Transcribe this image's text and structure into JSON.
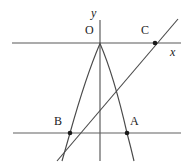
{
  "figure": {
    "type": "geometry-diagram",
    "canvas": {
      "width": 193,
      "height": 167,
      "background": "#ffffff"
    },
    "colors": {
      "axis": "#585858",
      "curve": "#4a4a4a",
      "line": "#4a4a4a",
      "auxiliary": "#606060",
      "point": "#1a1a1a",
      "label": "#1a1a1a"
    },
    "axes": {
      "x_axis": {
        "label": "x",
        "y": 43,
        "x_start": 12,
        "x_end": 181
      },
      "y_axis": {
        "label": "y",
        "x": 100,
        "y_start": 20,
        "y_end": 161
      },
      "origin_label": "O"
    },
    "auxiliary_line": {
      "y": 133,
      "x_start": 13,
      "x_end": 181
    },
    "points": [
      {
        "label": "O",
        "x": 100,
        "y": 43,
        "label_dx": -13,
        "label_dy": -17,
        "dot": false
      },
      {
        "label": "C",
        "x": 155,
        "y": 43,
        "label_dx": -13,
        "label_dy": -17,
        "dot": true
      },
      {
        "label": "A",
        "x": 127,
        "y": 133,
        "label_dx": 4,
        "label_dy": -16,
        "dot": true
      },
      {
        "label": "B",
        "x": 70,
        "y": 133,
        "label_dx": -16,
        "label_dy": -16,
        "dot": true
      }
    ],
    "parabola": {
      "vertex": {
        "x": 100,
        "y": 43
      },
      "passes_through": [
        "O",
        "B",
        "A"
      ],
      "opens": "down",
      "path": "M 62 161 Q 62 161 70 133 Q 86 76 100 43.5 Q 114 76 127 133 Q 131 148 134 161"
    },
    "secant_line": {
      "passes_through": [
        "B",
        "C"
      ],
      "x_start": 57,
      "y_start": 161,
      "x_end": 178,
      "y_end": 19
    },
    "extra_curve_tail": {
      "description": "short second branch descending from the parabola left branch",
      "path": "M 70 133 Q 66 147 63 161"
    }
  }
}
